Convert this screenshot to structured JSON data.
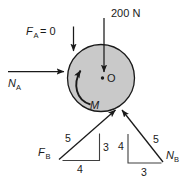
{
  "figure": {
    "type": "free-body-diagram",
    "background_color": "#ffffff",
    "ink_color": "#1a1a1a",
    "body": {
      "shape": "circle",
      "label": "O",
      "center_point_label": "O",
      "fill_color": "#c9c9c9",
      "stroke_color": "#1a1a1a",
      "center_x": 101,
      "center_y": 78,
      "radius": 33.5
    },
    "loads": [
      {
        "id": "load-fa",
        "label_main": "F",
        "label_sub": "A",
        "label_tail": " = 0",
        "full_text": "FA = 0",
        "direction": "down",
        "applied_at": "top-left of disk"
      },
      {
        "id": "load-200n",
        "label_main": "200 N",
        "full_text": "200 N",
        "direction": "down",
        "applied_at": "center O"
      },
      {
        "id": "load-na",
        "label_main": "N",
        "label_sub": "A",
        "full_text": "NA",
        "direction": "right",
        "applied_at": "left of disk"
      },
      {
        "id": "load-m",
        "label_main": "M",
        "full_text": "M",
        "direction": "counterclockwise",
        "applied_at": "about center O"
      },
      {
        "id": "load-fb",
        "label_main": "F",
        "label_sub": "B",
        "full_text": "FB",
        "direction": "up-right",
        "applied_at": "bottom of disk"
      },
      {
        "id": "load-nb",
        "label_main": "N",
        "label_sub": "B",
        "full_text": "NB",
        "direction": "up-left",
        "applied_at": "bottom of disk"
      }
    ],
    "slope_triangles": [
      {
        "id": "slope-triangle-fb",
        "for": "FB",
        "hypotenuse": "5",
        "vertical": "3",
        "horizontal": "4"
      },
      {
        "id": "slope-triangle-nb",
        "for": "NB",
        "hypotenuse": "5",
        "vertical": "4",
        "horizontal": "3"
      }
    ]
  },
  "labels": {
    "fa_f": "F",
    "fa_sub": "A",
    "fa_eq": "= 0",
    "force_200n": "200 N",
    "na_n": "N",
    "na_sub": "A",
    "moment_m": "M",
    "center_o": "O",
    "fb_f": "F",
    "fb_sub": "B",
    "nb_n": "N",
    "nb_sub": "B",
    "fb_tri_hyp": "5",
    "fb_tri_vert": "3",
    "fb_tri_horiz": "4",
    "nb_tri_hyp": "5",
    "nb_tri_vert": "4",
    "nb_tri_horiz": "3"
  }
}
